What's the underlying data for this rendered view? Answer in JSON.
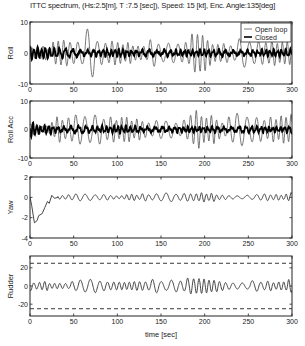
{
  "figure": {
    "title": "ITTC spectrum, (Hs:2.5[m], T :7.5 [sec]), Speed: 15 [kt], Enc. Angle:135[deg]",
    "xlabel": "time [sec]"
  },
  "legend": {
    "items": [
      {
        "label": "Open loop",
        "style": "thin-gray"
      },
      {
        "label": "Closed",
        "style": "thick-black"
      }
    ]
  },
  "chart_data": [
    {
      "type": "line",
      "title": "ITTC spectrum, (Hs:2.5[m], T :7.5 [sec]), Speed: 15 [kt], Enc. Angle:135[deg]",
      "ylabel": "Roll",
      "xlabel": "",
      "xlim": [
        0,
        300
      ],
      "ylim": [
        -10,
        10
      ],
      "xticks": [
        0,
        50,
        100,
        150,
        200,
        250,
        300
      ],
      "yticks": [
        -10,
        0,
        10
      ],
      "legend_position": "upper right",
      "series": [
        {
          "name": "Open loop",
          "style": "thin-gray",
          "amplitude_envelope": [
            [
              0,
              3
            ],
            [
              20,
              2
            ],
            [
              25,
              5
            ],
            [
              40,
              5
            ],
            [
              55,
              6
            ],
            [
              65,
              8.5
            ],
            [
              75,
              5
            ],
            [
              100,
              5
            ],
            [
              120,
              3
            ],
            [
              140,
              5
            ],
            [
              160,
              3
            ],
            [
              175,
              5
            ],
            [
              185,
              8
            ],
            [
              192,
              8.5
            ],
            [
              200,
              5
            ],
            [
              225,
              4
            ],
            [
              245,
              5
            ],
            [
              270,
              4
            ],
            [
              290,
              5
            ],
            [
              300,
              5
            ]
          ],
          "period_sec": 6.5
        },
        {
          "name": "Closed",
          "style": "thick-black",
          "amplitude_envelope": [
            [
              0,
              2
            ],
            [
              50,
              1.2
            ],
            [
              100,
              1.2
            ],
            [
              150,
              1
            ],
            [
              200,
              1
            ],
            [
              250,
              1
            ],
            [
              300,
              1
            ]
          ],
          "period_sec": 5
        }
      ]
    },
    {
      "type": "line",
      "ylabel": "Roll Acc",
      "xlim": [
        0,
        300
      ],
      "ylim": [
        -10,
        10
      ],
      "xticks": [
        0,
        50,
        100,
        150,
        200,
        250,
        300
      ],
      "yticks": [
        -10,
        0,
        10
      ],
      "series": [
        {
          "name": "Open loop",
          "style": "thin-gray",
          "amplitude_envelope": [
            [
              0,
              2
            ],
            [
              20,
              2
            ],
            [
              25,
              5
            ],
            [
              40,
              5
            ],
            [
              60,
              7
            ],
            [
              65,
              9
            ],
            [
              75,
              6
            ],
            [
              100,
              5
            ],
            [
              130,
              4
            ],
            [
              160,
              4
            ],
            [
              180,
              4
            ],
            [
              187,
              9.5
            ],
            [
              195,
              6
            ],
            [
              220,
              4
            ],
            [
              240,
              7
            ],
            [
              245,
              8
            ],
            [
              260,
              5
            ],
            [
              290,
              5
            ],
            [
              300,
              6
            ]
          ],
          "period_sec": 6.5
        },
        {
          "name": "Closed",
          "style": "thick-black",
          "amplitude_envelope": [
            [
              0,
              3
            ],
            [
              10,
              1.5
            ],
            [
              50,
              1.2
            ],
            [
              100,
              1.2
            ],
            [
              150,
              1
            ],
            [
              200,
              1
            ],
            [
              250,
              1
            ],
            [
              300,
              1
            ]
          ],
          "period_sec": 5
        }
      ]
    },
    {
      "type": "line",
      "ylabel": "Yaw",
      "xlim": [
        0,
        300
      ],
      "ylim": [
        -4,
        2
      ],
      "xticks": [
        0,
        50,
        100,
        150,
        200,
        250,
        300
      ],
      "yticks": [
        -4,
        -2,
        0,
        2
      ],
      "series": [
        {
          "name": "Yaw",
          "style": "thin-dark",
          "transient": [
            [
              0,
              0
            ],
            [
              2,
              -0.8
            ],
            [
              5,
              -2.5
            ],
            [
              8,
              -2.3
            ],
            [
              10,
              -1.8
            ],
            [
              14,
              -1.6
            ],
            [
              17,
              -1.0
            ],
            [
              20,
              -0.4
            ],
            [
              22,
              -0.6
            ],
            [
              25,
              0.2
            ],
            [
              28,
              -0.1
            ],
            [
              32,
              0.0
            ]
          ],
          "amplitude_envelope": [
            [
              32,
              0.2
            ],
            [
              45,
              0.3
            ],
            [
              55,
              0.5
            ],
            [
              65,
              0.55
            ],
            [
              75,
              0.3
            ],
            [
              100,
              0.2
            ],
            [
              120,
              0.35
            ],
            [
              150,
              0.45
            ],
            [
              165,
              0.5
            ],
            [
              180,
              0.55
            ],
            [
              200,
              0.5
            ],
            [
              225,
              0.2
            ],
            [
              250,
              0.3
            ],
            [
              270,
              0.35
            ],
            [
              290,
              0.35
            ],
            [
              300,
              0.6
            ]
          ],
          "period_sec": 6.5
        }
      ]
    },
    {
      "type": "line",
      "ylabel": "Rudder",
      "xlabel": "time [sec]",
      "xlim": [
        0,
        300
      ],
      "ylim": [
        -33,
        33
      ],
      "xticks": [
        0,
        50,
        100,
        150,
        200,
        250,
        300
      ],
      "yticks": [
        -20,
        0,
        20
      ],
      "reference_lines": [
        {
          "y": 25,
          "style": "dashed"
        },
        {
          "y": -25,
          "style": "dashed"
        }
      ],
      "series": [
        {
          "name": "Rudder",
          "style": "thin-dark",
          "amplitude_envelope": [
            [
              0,
              6
            ],
            [
              20,
              5
            ],
            [
              30,
              3
            ],
            [
              40,
              4
            ],
            [
              55,
              9
            ],
            [
              65,
              11
            ],
            [
              75,
              6
            ],
            [
              100,
              5
            ],
            [
              130,
              7
            ],
            [
              150,
              9
            ],
            [
              170,
              9
            ],
            [
              185,
              11
            ],
            [
              200,
              8
            ],
            [
              225,
              4
            ],
            [
              250,
              7
            ],
            [
              275,
              5
            ],
            [
              290,
              8
            ],
            [
              300,
              9
            ]
          ],
          "period_sec": 6.5
        }
      ]
    }
  ]
}
